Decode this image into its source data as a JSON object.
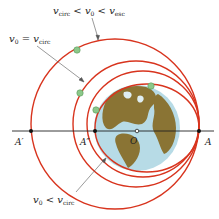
{
  "labels": {
    "top_condition": {
      "v": "v",
      "sub1": "circ",
      "op1": " < ",
      "v0": "v",
      "sub0": "0",
      "op2": " < ",
      "v2": "v",
      "sub2": "esc"
    },
    "circ_condition": {
      "v0": "v",
      "sub0": "0",
      "op": " = ",
      "v": "v",
      "sub": "circ"
    },
    "low_condition": {
      "v0": "v",
      "sub0": "0",
      "op": " < ",
      "v": "v",
      "sub": "circ"
    }
  },
  "points": {
    "A_prime": "A′",
    "A_double_prime": "A″",
    "O": "O",
    "A": "A"
  },
  "colors": {
    "orbit": "#d8341e",
    "axis": "#222222",
    "satellite": "#8cc88a",
    "earth_ocean": "#b7dbe6",
    "earth_land": "#8a7434",
    "leader": "#555555"
  },
  "orbits": [
    {
      "name": "escape-approach-ellipse",
      "cx": 115,
      "cy": 124,
      "rx": 84,
      "ry": 85
    },
    {
      "name": "circular-orbit",
      "cx": 136,
      "cy": 124,
      "rx": 63,
      "ry": 63
    },
    {
      "name": "intermediate-ellipse",
      "cx": 143,
      "cy": 124,
      "rx": 56,
      "ry": 53
    },
    {
      "name": "low-velocity-ellipse",
      "cx": 147,
      "cy": 128,
      "rx": 52,
      "ry": 44
    }
  ]
}
